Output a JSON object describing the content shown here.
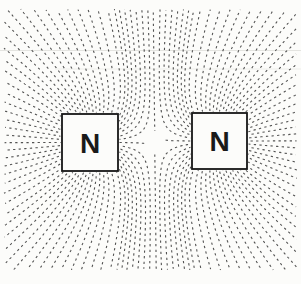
{
  "diagram": {
    "type": "magnetic-field-lines-two-like-poles",
    "canvas": {
      "width": 301,
      "height": 284
    },
    "background": "#fcfcfa",
    "line_color": "#2d2d2d",
    "line_opacity": 0.82,
    "line_width": 1.1,
    "dash": "2.3 3.3",
    "lines_per_pole": 60,
    "stall_threshold": 0.0042,
    "separatrix_offset": 11,
    "trace_bounds": {
      "xmin": 4,
      "xmax": 297,
      "ymin": 9,
      "ymax": 270
    },
    "box_fill": "#fcfcfa",
    "box_stroke": "#161616",
    "box_stroke_width": 1.8,
    "label_color": "#1a1a1a",
    "label_font_size": 28,
    "poles": [
      {
        "label": "N",
        "box": {
          "x": 62,
          "y": 114,
          "w": 56,
          "h": 57
        }
      },
      {
        "label": "N",
        "box": {
          "x": 192,
          "y": 113,
          "w": 55,
          "h": 56
        }
      }
    ],
    "artifacts": [
      {
        "y": 50.5,
        "x1": 0,
        "x2": 301,
        "color": "#e4e4e0"
      },
      {
        "y": 69.0,
        "x1": 55,
        "x2": 301,
        "color": "#eeeeea"
      }
    ]
  }
}
